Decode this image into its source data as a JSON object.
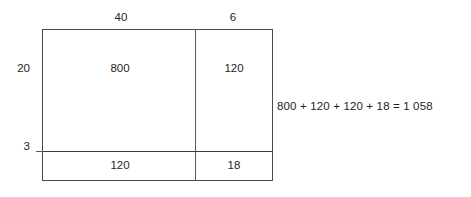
{
  "diagram": {
    "type": "area-model-multiplication",
    "column_labels": [
      "40",
      "6"
    ],
    "row_labels": [
      "20",
      "3"
    ],
    "cells": [
      {
        "row": 0,
        "col": 0,
        "value": "800"
      },
      {
        "row": 0,
        "col": 1,
        "value": "120"
      },
      {
        "row": 1,
        "col": 0,
        "value": "120"
      },
      {
        "row": 1,
        "col": 1,
        "value": "18"
      }
    ],
    "equation": "800 + 120 + 120 + 18 = 1 058",
    "colors": {
      "line": "#4a4a4a",
      "text": "#1f1f1f",
      "background": "#ffffff"
    }
  }
}
